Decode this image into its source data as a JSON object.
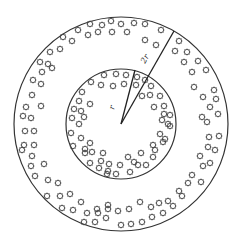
{
  "diagram": {
    "type": "concentric-circles",
    "center": [
      121,
      124
    ],
    "outer_circle": {
      "radius": 107,
      "label": "2r"
    },
    "inner_circle": {
      "radius": 55,
      "label": "r"
    },
    "radius_lines": [
      {
        "name": "inner-radius",
        "label": "r",
        "end": [
          135,
          70
        ]
      },
      {
        "name": "outer-radius",
        "label": "2r",
        "end": [
          174,
          31
        ]
      }
    ],
    "colors": {
      "stroke": "#333333",
      "background": "#ffffff"
    },
    "particle_glyph": "star-outline",
    "particles": {
      "outer_ring": [
        [
          90,
          24
        ],
        [
          102,
          25
        ],
        [
          111,
          21
        ],
        [
          121,
          24
        ],
        [
          134,
          23
        ],
        [
          145,
          24
        ],
        [
          161,
          30
        ],
        [
          78,
          30
        ],
        [
          88,
          35
        ],
        [
          98,
          32
        ],
        [
          112,
          32
        ],
        [
          127,
          32
        ],
        [
          63,
          37
        ],
        [
          72,
          41
        ],
        [
          145,
          40
        ],
        [
          156,
          45
        ],
        [
          179,
          41
        ],
        [
          60,
          49
        ],
        [
          50,
          52
        ],
        [
          175,
          51
        ],
        [
          187,
          52
        ],
        [
          40,
          62
        ],
        [
          48,
          64
        ],
        [
          184,
          62
        ],
        [
          198,
          61
        ],
        [
          42,
          72
        ],
        [
          52,
          68
        ],
        [
          33,
          80
        ],
        [
          41,
          84
        ],
        [
          192,
          72
        ],
        [
          206,
          70
        ],
        [
          32,
          95
        ],
        [
          26,
          107
        ],
        [
          41,
          106
        ],
        [
          194,
          87
        ],
        [
          214,
          90
        ],
        [
          216,
          99
        ],
        [
          23,
          116
        ],
        [
          31,
          118
        ],
        [
          203,
          97
        ],
        [
          202,
          117
        ],
        [
          25,
          131
        ],
        [
          34,
          131
        ],
        [
          210,
          107
        ],
        [
          218,
          114
        ],
        [
          207,
          122
        ],
        [
          24,
          145
        ],
        [
          34,
          145
        ],
        [
          209,
          137
        ],
        [
          219,
          136
        ],
        [
          215,
          150
        ],
        [
          22,
          150
        ],
        [
          32,
          156
        ],
        [
          200,
          156
        ],
        [
          208,
          147
        ],
        [
          203,
          166
        ],
        [
          31,
          166
        ],
        [
          44,
          164
        ],
        [
          210,
          163
        ],
        [
          192,
          175
        ],
        [
          201,
          182
        ],
        [
          35,
          176
        ],
        [
          48,
          180
        ],
        [
          58,
          183
        ],
        [
          188,
          183
        ],
        [
          179,
          191
        ],
        [
          47,
          196
        ],
        [
          60,
          196
        ],
        [
          70,
          194
        ],
        [
          182,
          196
        ],
        [
          168,
          201
        ],
        [
          62,
          208
        ],
        [
          73,
          210
        ],
        [
          81,
          202
        ],
        [
          97,
          209
        ],
        [
          108,
          205
        ],
        [
          87,
          213
        ],
        [
          98,
          213
        ],
        [
          108,
          209
        ],
        [
          118,
          211
        ],
        [
          129,
          209
        ],
        [
          140,
          202
        ],
        [
          151,
          207
        ],
        [
          159,
          203
        ],
        [
          173,
          206
        ],
        [
          84,
          222
        ],
        [
          95,
          222
        ],
        [
          106,
          218
        ],
        [
          121,
          225
        ],
        [
          131,
          224
        ],
        [
          142,
          222
        ],
        [
          152,
          217
        ],
        [
          163,
          213
        ]
      ],
      "inner_ring": [
        [
          104,
          75
        ],
        [
          116,
          74
        ],
        [
          126,
          75
        ],
        [
          137,
          77
        ],
        [
          145,
          80
        ],
        [
          91,
          82
        ],
        [
          101,
          85
        ],
        [
          113,
          86
        ],
        [
          124,
          84
        ],
        [
          136,
          85
        ],
        [
          151,
          86
        ],
        [
          82,
          92
        ],
        [
          142,
          96
        ],
        [
          150,
          95
        ],
        [
          160,
          96
        ],
        [
          79,
          101
        ],
        [
          90,
          104
        ],
        [
          154,
          107
        ],
        [
          164,
          106
        ],
        [
          74,
          109
        ],
        [
          81,
          111
        ],
        [
          164,
          114
        ],
        [
          170,
          115
        ],
        [
          72,
          118
        ],
        [
          84,
          117
        ],
        [
          162,
          120
        ],
        [
          168,
          124
        ],
        [
          79,
          124
        ],
        [
          170,
          126
        ],
        [
          71,
          133
        ],
        [
          160,
          134
        ],
        [
          165,
          139
        ],
        [
          81,
          138
        ],
        [
          90,
          143
        ],
        [
          163,
          142
        ],
        [
          73,
          146
        ],
        [
          85,
          149
        ],
        [
          153,
          145
        ],
        [
          85,
          153
        ],
        [
          92,
          152
        ],
        [
          103,
          153
        ],
        [
          141,
          153
        ],
        [
          155,
          150
        ],
        [
          90,
          163
        ],
        [
          101,
          161
        ],
        [
          109,
          164
        ],
        [
          128,
          157
        ],
        [
          138,
          165
        ],
        [
          153,
          157
        ],
        [
          99,
          168
        ],
        [
          108,
          171
        ],
        [
          120,
          165
        ],
        [
          134,
          162
        ],
        [
          146,
          165
        ],
        [
          107,
          174
        ],
        [
          116,
          174
        ],
        [
          130,
          172
        ]
      ]
    }
  }
}
